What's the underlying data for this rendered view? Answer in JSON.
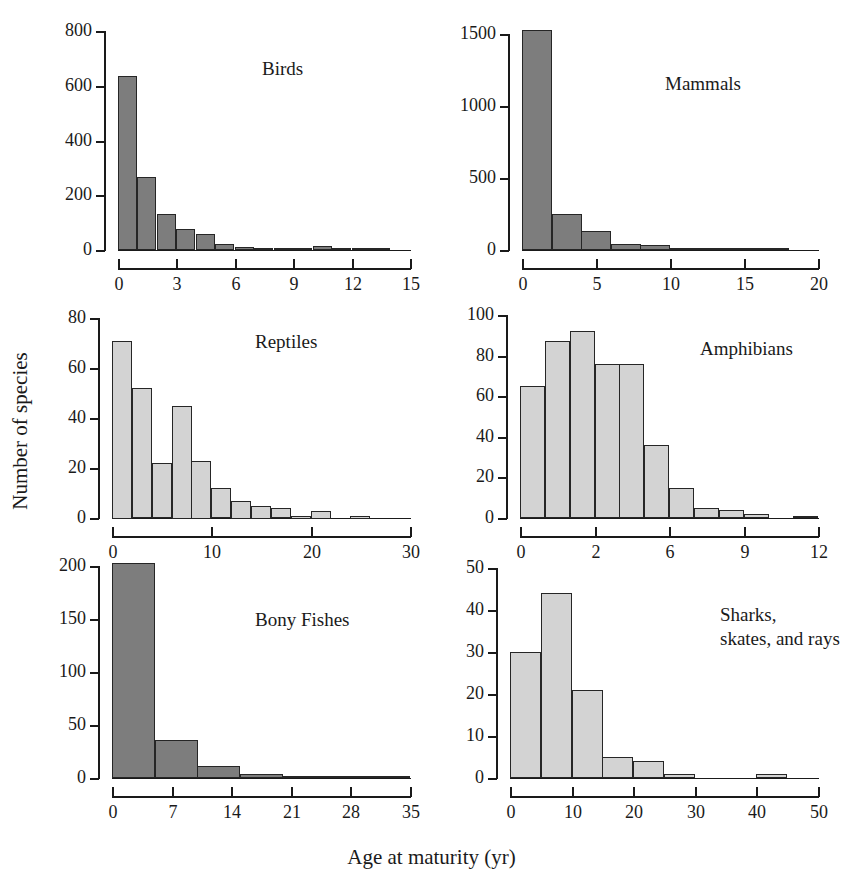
{
  "figure": {
    "ylabel": "Number of species",
    "xlabel": "Age at maturity (yr)"
  },
  "colors": {
    "dark_fill": "#7d7d7d",
    "light_fill": "#d3d3d3",
    "edge": "#262626",
    "text": "#1a1a1a",
    "background": "#ffffff"
  },
  "chart_data": [
    {
      "type": "bar",
      "title": "Birds",
      "xlabel": "Age at maturity (yr)",
      "ylabel": "Number of species",
      "xlim": [
        0,
        15
      ],
      "ylim": [
        0,
        800
      ],
      "xticks": [
        0,
        3,
        6,
        9,
        12,
        15
      ],
      "xtick_labels": [
        "0",
        "3",
        "6",
        "9",
        "12",
        "15"
      ],
      "yticks": [
        0,
        200,
        400,
        600,
        800
      ],
      "ytick_labels": [
        "0",
        "200",
        "400",
        "600",
        "800"
      ],
      "bin_width": 1,
      "fill": "dark",
      "grid": false,
      "bins": [
        {
          "x0": 0,
          "x1": 1,
          "value": 637
        },
        {
          "x0": 1,
          "x1": 2,
          "value": 266
        },
        {
          "x0": 2,
          "x1": 3,
          "value": 131
        },
        {
          "x0": 3,
          "x1": 4,
          "value": 78
        },
        {
          "x0": 4,
          "x1": 5,
          "value": 57
        },
        {
          "x0": 5,
          "x1": 6,
          "value": 22
        },
        {
          "x0": 6,
          "x1": 7,
          "value": 11
        },
        {
          "x0": 7,
          "x1": 8,
          "value": 4
        },
        {
          "x0": 8,
          "x1": 9,
          "value": 2
        },
        {
          "x0": 9,
          "x1": 10,
          "value": 2
        },
        {
          "x0": 10,
          "x1": 11,
          "value": 13
        },
        {
          "x0": 11,
          "x1": 12,
          "value": 2
        },
        {
          "x0": 12,
          "x1": 13,
          "value": 1
        },
        {
          "x0": 13,
          "x1": 14,
          "value": 1
        }
      ]
    },
    {
      "type": "bar",
      "title": "Mammals",
      "xlabel": "Age at maturity (yr)",
      "ylabel": "Number of species",
      "xlim": [
        0,
        20
      ],
      "ylim": [
        0,
        1500
      ],
      "xticks": [
        0,
        5,
        10,
        15,
        20
      ],
      "xtick_labels": [
        "0",
        "5",
        "10",
        "15",
        "20"
      ],
      "yticks": [
        0,
        500,
        1000,
        1500
      ],
      "ytick_labels": [
        "0",
        "500",
        "1000",
        "1500"
      ],
      "bin_width": 2,
      "fill": "dark",
      "grid": false,
      "bins": [
        {
          "x0": 0,
          "x1": 2,
          "value": 1530
        },
        {
          "x0": 2,
          "x1": 4,
          "value": 250
        },
        {
          "x0": 4,
          "x1": 6,
          "value": 135
        },
        {
          "x0": 6,
          "x1": 8,
          "value": 40
        },
        {
          "x0": 8,
          "x1": 10,
          "value": 38
        },
        {
          "x0": 10,
          "x1": 12,
          "value": 14
        },
        {
          "x0": 12,
          "x1": 14,
          "value": 4
        },
        {
          "x0": 14,
          "x1": 16,
          "value": 2
        },
        {
          "x0": 16,
          "x1": 18,
          "value": 2
        }
      ]
    },
    {
      "type": "bar",
      "title": "Reptiles",
      "xlabel": "Age at maturity (yr)",
      "ylabel": "Number of species",
      "xlim": [
        0,
        30
      ],
      "ylim": [
        0,
        80
      ],
      "xticks": [
        0,
        10,
        20,
        30
      ],
      "xtick_labels": [
        "0",
        "10",
        "20",
        "30"
      ],
      "yticks": [
        0,
        20,
        40,
        60,
        80
      ],
      "ytick_labels": [
        "0",
        "20",
        "40",
        "60",
        "80"
      ],
      "bin_width": 2,
      "fill": "light",
      "grid": false,
      "bins": [
        {
          "x0": 0,
          "x1": 2,
          "value": 71
        },
        {
          "x0": 2,
          "x1": 4,
          "value": 52
        },
        {
          "x0": 4,
          "x1": 6,
          "value": 22
        },
        {
          "x0": 6,
          "x1": 8,
          "value": 45
        },
        {
          "x0": 8,
          "x1": 10,
          "value": 23
        },
        {
          "x0": 10,
          "x1": 12,
          "value": 12
        },
        {
          "x0": 12,
          "x1": 14,
          "value": 7
        },
        {
          "x0": 14,
          "x1": 16,
          "value": 5
        },
        {
          "x0": 16,
          "x1": 18,
          "value": 4
        },
        {
          "x0": 18,
          "x1": 20,
          "value": 1
        },
        {
          "x0": 20,
          "x1": 22,
          "value": 3
        },
        {
          "x0": 24,
          "x1": 26,
          "value": 1
        }
      ]
    },
    {
      "type": "bar",
      "title": "Amphibians",
      "xlabel": "Age at maturity (yr)",
      "ylabel": "Number of species",
      "xlim": [
        0,
        12
      ],
      "ylim": [
        0,
        100
      ],
      "xticks": [
        0,
        2,
        6,
        9,
        12
      ],
      "xtick_labels": [
        "0",
        "2",
        "6",
        "9",
        "12"
      ],
      "yticks": [
        0,
        20,
        40,
        60,
        80,
        100
      ],
      "ytick_labels": [
        "0",
        "20",
        "40",
        "60",
        "80",
        "100"
      ],
      "bin_width": 1,
      "fill": "light",
      "grid": false,
      "bins": [
        {
          "x0": 0,
          "x1": 1,
          "value": 65
        },
        {
          "x0": 1,
          "x1": 2,
          "value": 87
        },
        {
          "x0": 2,
          "x1": 3,
          "value": 92
        },
        {
          "x0": 3,
          "x1": 4,
          "value": 76
        },
        {
          "x0": 4,
          "x1": 5,
          "value": 76
        },
        {
          "x0": 5,
          "x1": 6,
          "value": 36
        },
        {
          "x0": 6,
          "x1": 7,
          "value": 15
        },
        {
          "x0": 7,
          "x1": 8,
          "value": 5
        },
        {
          "x0": 8,
          "x1": 9,
          "value": 4
        },
        {
          "x0": 9,
          "x1": 10,
          "value": 2
        },
        {
          "x0": 11,
          "x1": 12,
          "value": 1
        }
      ]
    },
    {
      "type": "bar",
      "title": "Bony Fishes",
      "xlabel": "Age at maturity (yr)",
      "ylabel": "Number of species",
      "xlim": [
        0,
        35
      ],
      "ylim": [
        0,
        200
      ],
      "xticks": [
        0,
        7,
        14,
        21,
        28,
        35
      ],
      "xtick_labels": [
        "0",
        "7",
        "14",
        "21",
        "28",
        "35"
      ],
      "yticks": [
        0,
        50,
        100,
        150,
        200
      ],
      "ytick_labels": [
        "0",
        "50",
        "100",
        "150",
        "200"
      ],
      "bin_width": 5,
      "fill": "dark",
      "grid": false,
      "bins": [
        {
          "x0": 0,
          "x1": 5,
          "value": 203
        },
        {
          "x0": 5,
          "x1": 10,
          "value": 36
        },
        {
          "x0": 10,
          "x1": 15,
          "value": 11
        },
        {
          "x0": 15,
          "x1": 20,
          "value": 4
        },
        {
          "x0": 20,
          "x1": 25,
          "value": 1
        },
        {
          "x0": 25,
          "x1": 30,
          "value": 2
        },
        {
          "x0": 30,
          "x1": 35,
          "value": 1
        }
      ]
    },
    {
      "type": "bar",
      "title": "Sharks,\nskates, and rays",
      "xlabel": "Age at maturity (yr)",
      "ylabel": "Number of species",
      "xlim": [
        0,
        50
      ],
      "ylim": [
        0,
        50
      ],
      "xticks": [
        0,
        10,
        20,
        30,
        40,
        50
      ],
      "xtick_labels": [
        "0",
        "10",
        "20",
        "30",
        "40",
        "50"
      ],
      "yticks": [
        0,
        10,
        20,
        30,
        40,
        50
      ],
      "ytick_labels": [
        "0",
        "10",
        "20",
        "30",
        "40",
        "50"
      ],
      "bin_width": 5,
      "fill": "light",
      "grid": false,
      "bins": [
        {
          "x0": 0,
          "x1": 5,
          "value": 30
        },
        {
          "x0": 5,
          "x1": 10,
          "value": 44
        },
        {
          "x0": 10,
          "x1": 15,
          "value": 21
        },
        {
          "x0": 15,
          "x1": 20,
          "value": 5
        },
        {
          "x0": 20,
          "x1": 25,
          "value": 4
        },
        {
          "x0": 25,
          "x1": 30,
          "value": 1
        },
        {
          "x0": 40,
          "x1": 45,
          "value": 1
        }
      ]
    }
  ],
  "panel_layout": [
    {
      "index": 0,
      "plot_left": 118,
      "plot_right": 410,
      "plot_top": 31,
      "plot_bottom": 250,
      "title_x": 262,
      "title_y": 57
    },
    {
      "index": 1,
      "plot_left": 522,
      "plot_right": 818,
      "plot_top": 34,
      "plot_bottom": 250,
      "title_x": 665,
      "title_y": 72
    },
    {
      "index": 2,
      "plot_left": 112,
      "plot_right": 410,
      "plot_top": 318,
      "plot_bottom": 518,
      "title_x": 255,
      "title_y": 330
    },
    {
      "index": 3,
      "plot_left": 520,
      "plot_right": 818,
      "plot_top": 315,
      "plot_bottom": 518,
      "title_x": 700,
      "title_y": 337
    },
    {
      "index": 4,
      "plot_left": 112,
      "plot_right": 410,
      "plot_top": 566,
      "plot_bottom": 778,
      "title_x": 255,
      "title_y": 608
    },
    {
      "index": 5,
      "plot_left": 510,
      "plot_right": 818,
      "plot_top": 568,
      "plot_bottom": 778,
      "title_x": 720,
      "title_y": 603
    }
  ]
}
